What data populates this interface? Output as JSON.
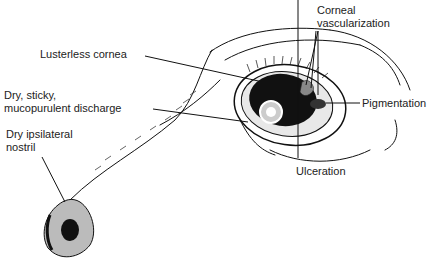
{
  "diagram": {
    "labels": {
      "corneal_vascularization_line1": "Corneal",
      "corneal_vascularization_line2": "vascularization",
      "lusterless_cornea": "Lusterless cornea",
      "discharge_line1": "Dry, sticky,",
      "discharge_line2": "mucopurulent discharge",
      "pigmentation": "Pigmentation",
      "nostril_line1": "Dry ipsilateral",
      "nostril_line2": "nostril",
      "ulceration": "Ulceration"
    },
    "colors": {
      "ink": "#111111",
      "text": "#222222",
      "background": "#ffffff"
    }
  }
}
